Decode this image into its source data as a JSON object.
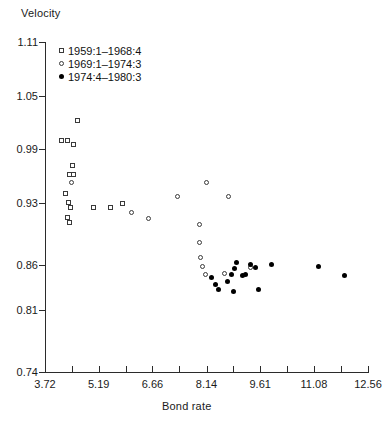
{
  "chart_data": {
    "type": "scatter",
    "title": "",
    "xlabel": "Bond rate",
    "ylabel": "Velocity",
    "xlim": [
      3.72,
      12.56
    ],
    "ylim": [
      0.74,
      1.11
    ],
    "grid": false,
    "legend_position": "top-left",
    "x_ticks": [
      "3.72",
      "5.19",
      "6.66",
      "8.14",
      "9.61",
      "11.08",
      "12.56"
    ],
    "x_tick_values": [
      3.72,
      5.19,
      6.66,
      8.14,
      9.61,
      11.08,
      12.56
    ],
    "x_minor_tick_values": [
      4.455,
      5.925,
      7.4,
      8.875,
      10.345,
      11.82
    ],
    "y_ticks": [
      "1.11",
      "1.05",
      "0.99",
      "0.93",
      "0.86",
      "0.81",
      "0.74"
    ],
    "y_tick_values": [
      1.11,
      1.05,
      0.99,
      0.93,
      0.86,
      0.81,
      0.74
    ],
    "series": [
      {
        "name": "1959:1–1968:4",
        "marker": "square",
        "color": "#3a3a3a",
        "points": [
          [
            4.6,
            1.022
          ],
          [
            4.17,
            1.0
          ],
          [
            4.33,
            1.0
          ],
          [
            4.5,
            0.995
          ],
          [
            4.47,
            0.972
          ],
          [
            4.38,
            0.962
          ],
          [
            4.5,
            0.961
          ],
          [
            4.27,
            0.94
          ],
          [
            4.35,
            0.93
          ],
          [
            4.43,
            0.925
          ],
          [
            4.33,
            0.913
          ],
          [
            4.4,
            0.908
          ],
          [
            5.05,
            0.925
          ],
          [
            5.5,
            0.924
          ],
          [
            5.85,
            0.929
          ]
        ]
      },
      {
        "name": "1969:1–1974:3",
        "marker": "circle",
        "color": "#3a3a3a",
        "points": [
          [
            4.45,
            0.953
          ],
          [
            6.1,
            0.919
          ],
          [
            6.55,
            0.912
          ],
          [
            7.35,
            0.937
          ],
          [
            8.15,
            0.952
          ],
          [
            8.75,
            0.937
          ],
          [
            7.95,
            0.905
          ],
          [
            7.95,
            0.885
          ],
          [
            7.98,
            0.868
          ],
          [
            8.02,
            0.858
          ],
          [
            8.1,
            0.849
          ],
          [
            8.62,
            0.85
          ],
          [
            9.35,
            0.857
          ]
        ]
      },
      {
        "name": "1974:4–1980:3",
        "marker": "dot",
        "color": "#000000",
        "points": [
          [
            8.28,
            0.846
          ],
          [
            8.38,
            0.838
          ],
          [
            8.48,
            0.833
          ],
          [
            8.72,
            0.841
          ],
          [
            8.82,
            0.849
          ],
          [
            8.9,
            0.856
          ],
          [
            8.95,
            0.863
          ],
          [
            8.88,
            0.83
          ],
          [
            9.12,
            0.848
          ],
          [
            9.22,
            0.849
          ],
          [
            9.35,
            0.86
          ],
          [
            9.48,
            0.857
          ],
          [
            9.55,
            0.832
          ],
          [
            9.92,
            0.861
          ],
          [
            11.2,
            0.858
          ],
          [
            11.92,
            0.848
          ]
        ]
      }
    ]
  },
  "axes": {
    "y_title": "Velocity",
    "x_title": "Bond rate"
  }
}
